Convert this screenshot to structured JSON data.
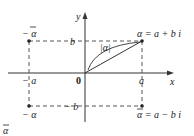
{
  "diagram": {
    "type": "complex-plane",
    "axes": {
      "x_label": "x",
      "y_label": "y",
      "origin_label": "0"
    },
    "ticks": {
      "x_pos": "a",
      "x_neg": "− a",
      "y_pos": "b",
      "y_neg": "− b"
    },
    "points": {
      "alpha": {
        "label": "α = a + b i",
        "x": "a",
        "y": "b"
      },
      "neg_conj": {
        "label": "− α",
        "x": "-a",
        "y": "b",
        "bar": true
      },
      "neg_alpha": {
        "label": "− α",
        "x": "-a",
        "y": "-b"
      },
      "conj": {
        "label": "α = a − b i",
        "x": "a",
        "y": "-b",
        "bar": true
      }
    },
    "modulus_label": "|α|",
    "caption": "α",
    "colors": {
      "ink": "#222222",
      "background": "#ffffff"
    }
  }
}
